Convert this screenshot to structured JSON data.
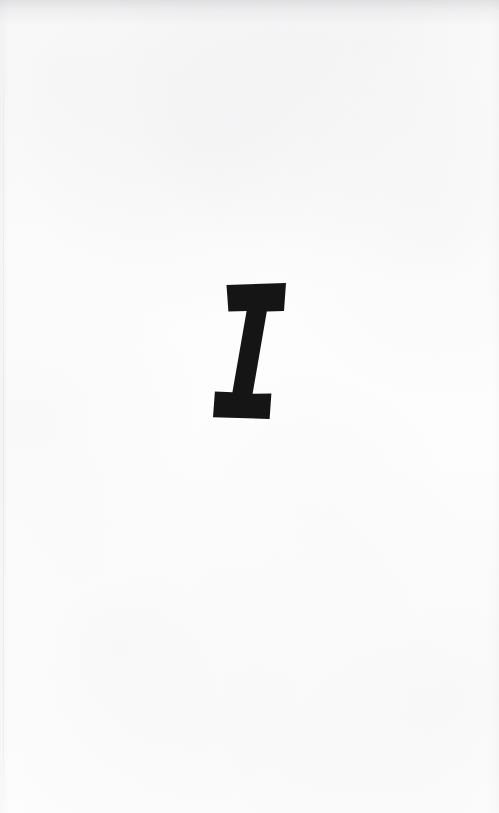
{
  "page": {
    "kind": "scanned-book-page",
    "role": "part-divider",
    "paper_color": "#fdfdfd",
    "ink_color": "#151515",
    "width": 499,
    "height": 813
  },
  "divider": {
    "numeral": "I",
    "numeral_name": "roman-numeral-one",
    "style": "bold-italic-slab-serif",
    "alignment": "center",
    "bbox": {
      "x": 218,
      "y": 283,
      "width": 73,
      "height": 136
    }
  },
  "artifacts": {
    "top_shadow_label": "scan-shadow-top",
    "gutter_line_label": "gutter-line-left",
    "grain_label": "paper-grain"
  }
}
